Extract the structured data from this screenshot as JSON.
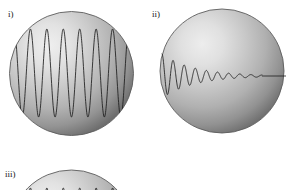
{
  "figure": {
    "background_color": "#ffffff",
    "sphere_highlight_color": "#ececec",
    "sphere_mid_color": "#b4b4b4",
    "sphere_edge_color": "#6d6d6d",
    "sphere_outline_color": "#5c5c5c",
    "curve_color": "#1c1c1c"
  },
  "panels": [
    {
      "id": "panel-i",
      "label": "i)",
      "label_x": 8,
      "label_y": 10,
      "sphere": {
        "cx": 71.5,
        "cy": 73.5,
        "r": 62
      },
      "wave": {
        "kind": "sustained-sinusoid",
        "cycles": 7,
        "amplitude": 44,
        "x_start": 14,
        "x_end": 129,
        "baseline_y": 73
      }
    },
    {
      "id": "panel-ii",
      "label": "ii)",
      "label_x": 152,
      "label_y": 10,
      "sphere": {
        "cx": 222,
        "cy": 71,
        "r": 62
      },
      "wave": {
        "kind": "damped-oscillation",
        "cycles": 9,
        "amplitude_start": 22,
        "decay": 3.1,
        "x_start": 162,
        "x_end": 262,
        "baseline_y": 76,
        "tail_x_end": 286
      }
    },
    {
      "id": "panel-iii",
      "label": "iii)",
      "label_x": 5,
      "label_y": 170,
      "sphere": {
        "cx": 71.5,
        "cy": 232,
        "r": 62
      },
      "wave": {
        "kind": "clipped-wave",
        "cycles": 7,
        "amplitude": 44,
        "x_start": 14,
        "x_end": 129,
        "baseline_y": 232
      }
    }
  ]
}
